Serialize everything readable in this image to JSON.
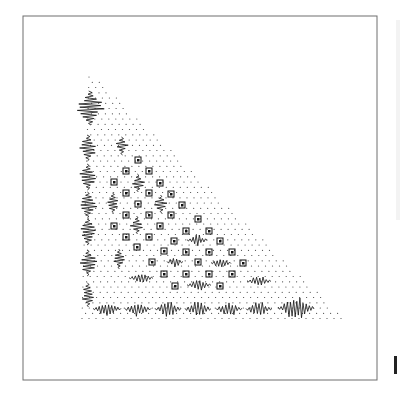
{
  "figure": {
    "frame": {
      "x": 23,
      "y": 16,
      "w": 354,
      "h": 364,
      "stroke": "#6e6e6e"
    },
    "triangle": {
      "top": [
        93,
        77
      ],
      "bottom_left": [
        86,
        318
      ],
      "bottom_right": [
        342,
        318
      ]
    },
    "dot_spacing": 7,
    "colors": {
      "ink": "#111111",
      "dot": "#444444",
      "frame": "#6e6e6e"
    },
    "left_column_wiggles": [
      {
        "x": 90,
        "y": 108,
        "amp": 16,
        "len": 34
      },
      {
        "x": 88,
        "y": 148,
        "amp": 10,
        "len": 26
      },
      {
        "x": 88,
        "y": 177,
        "amp": 10,
        "len": 26
      },
      {
        "x": 88,
        "y": 205,
        "amp": 10,
        "len": 26
      },
      {
        "x": 88,
        "y": 232,
        "amp": 10,
        "len": 26
      },
      {
        "x": 88,
        "y": 263,
        "amp": 10,
        "len": 26
      },
      {
        "x": 88,
        "y": 295,
        "amp": 8,
        "len": 24
      }
    ],
    "bottom_row_wiggles": [
      {
        "x": 107,
        "y": 309,
        "amp": 8,
        "len": 28
      },
      {
        "x": 138,
        "y": 309,
        "amp": 8,
        "len": 26
      },
      {
        "x": 168,
        "y": 309,
        "amp": 8,
        "len": 26
      },
      {
        "x": 198,
        "y": 309,
        "amp": 8,
        "len": 26
      },
      {
        "x": 229,
        "y": 309,
        "amp": 8,
        "len": 26
      },
      {
        "x": 259,
        "y": 309,
        "amp": 8,
        "len": 26
      },
      {
        "x": 296,
        "y": 308,
        "amp": 13,
        "len": 36
      }
    ],
    "inner_wiggles": [
      {
        "x": 122,
        "y": 146,
        "amp": 7,
        "len": 18,
        "vertical": true
      },
      {
        "x": 138,
        "y": 183,
        "amp": 7,
        "len": 18,
        "vertical": true
      },
      {
        "x": 113,
        "y": 203,
        "amp": 7,
        "len": 20,
        "vertical": true
      },
      {
        "x": 161,
        "y": 204,
        "amp": 7,
        "len": 18,
        "vertical": true
      },
      {
        "x": 137,
        "y": 225,
        "amp": 7,
        "len": 18,
        "vertical": true
      },
      {
        "x": 119,
        "y": 259,
        "amp": 7,
        "len": 20,
        "vertical": true
      },
      {
        "x": 197,
        "y": 240,
        "amp": 6,
        "len": 20
      },
      {
        "x": 175,
        "y": 262,
        "amp": 6,
        "len": 16
      },
      {
        "x": 221,
        "y": 263,
        "amp": 6,
        "len": 20
      },
      {
        "x": 141,
        "y": 278,
        "amp": 6,
        "len": 24
      },
      {
        "x": 199,
        "y": 285,
        "amp": 6,
        "len": 24
      },
      {
        "x": 259,
        "y": 281,
        "amp": 6,
        "len": 24
      }
    ],
    "squares": [
      [
        138,
        160
      ],
      [
        126,
        171
      ],
      [
        149,
        171
      ],
      [
        114,
        182
      ],
      [
        160,
        183
      ],
      [
        126,
        193
      ],
      [
        149,
        193
      ],
      [
        171,
        194
      ],
      [
        138,
        204
      ],
      [
        182,
        205
      ],
      [
        126,
        215
      ],
      [
        149,
        215
      ],
      [
        171,
        215
      ],
      [
        114,
        226
      ],
      [
        160,
        226
      ],
      [
        198,
        219
      ],
      [
        126,
        237
      ],
      [
        149,
        237
      ],
      [
        186,
        231
      ],
      [
        209,
        231
      ],
      [
        137,
        247
      ],
      [
        174,
        241
      ],
      [
        220,
        241
      ],
      [
        164,
        251
      ],
      [
        186,
        252
      ],
      [
        209,
        252
      ],
      [
        232,
        252
      ],
      [
        152,
        262
      ],
      [
        198,
        262
      ],
      [
        243,
        263
      ],
      [
        164,
        274
      ],
      [
        186,
        274
      ],
      [
        209,
        274
      ],
      [
        232,
        274
      ],
      [
        175,
        286
      ],
      [
        220,
        286
      ]
    ]
  }
}
